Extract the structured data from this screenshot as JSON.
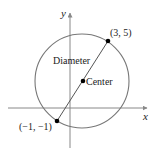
{
  "diagram": {
    "type": "circle-on-coordinate-plane",
    "axes": {
      "x_label": "x",
      "y_label": "y"
    },
    "circle": {
      "label_diameter": "Diameter",
      "label_center": "Center"
    },
    "points": [
      {
        "name": "endpoint-upper",
        "label": "(3, 5)"
      },
      {
        "name": "endpoint-lower",
        "label": "(−1, −1)"
      }
    ],
    "colors": {
      "circle": "#777777",
      "axis": "#888888",
      "diameter": "#555555",
      "dot": "#000000",
      "text": "#222222"
    }
  }
}
